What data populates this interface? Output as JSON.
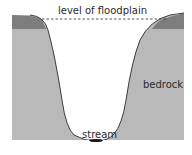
{
  "diagram": {
    "type": "cross-section",
    "labels": {
      "floodplain": "level of floodplain",
      "bedrock": "bedrock",
      "stream": "stream"
    },
    "colors": {
      "bedrock": "#b9b9b9",
      "soil_layer": "#7d7d7d",
      "valley": "#ffffff",
      "outline": "#2a2a2a",
      "stream": "#1a1a1a"
    }
  }
}
